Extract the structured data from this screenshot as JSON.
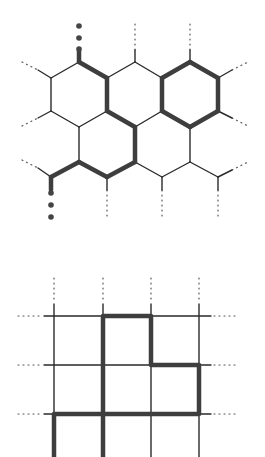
{
  "figure": {
    "colors": {
      "thin_line": "#2a2a2a",
      "thick_line": "#3e3e3e",
      "dots": "#555555",
      "background": "#ffffff"
    }
  },
  "hex_lattice": {
    "vertices": {
      "a1": [
        79,
        62
      ],
      "a2": [
        135,
        62
      ],
      "a3": [
        190,
        62
      ],
      "b0": [
        51,
        78
      ],
      "b1": [
        107,
        78
      ],
      "b2": [
        162,
        78
      ],
      "b3": [
        218,
        78
      ],
      "c0": [
        51,
        111
      ],
      "c1": [
        107,
        111
      ],
      "c2": [
        162,
        111
      ],
      "c3": [
        218,
        111
      ],
      "d1": [
        79,
        127
      ],
      "d2": [
        135,
        127
      ],
      "d3": [
        190,
        127
      ],
      "e1": [
        79,
        162
      ],
      "e2": [
        135,
        162
      ],
      "e3": [
        190,
        162
      ],
      "f0": [
        51,
        177
      ],
      "f1": [
        107,
        177
      ],
      "f2": [
        162,
        177
      ],
      "f3": [
        218,
        177
      ]
    },
    "thin_edges": [
      [
        "b0",
        "a1"
      ],
      [
        "b0",
        "c0"
      ],
      [
        "c0",
        "d1"
      ],
      [
        "d1",
        "c1"
      ],
      [
        "b1",
        "a2"
      ],
      [
        "a2",
        "b2"
      ],
      [
        "c1",
        "d2"
      ],
      [
        "d2",
        "c2"
      ],
      [
        "d1",
        "e1"
      ],
      [
        "e2",
        "f2"
      ],
      [
        "d3",
        "e3"
      ],
      [
        "e3",
        "f2"
      ],
      [
        "e3",
        "f3"
      ]
    ],
    "thick_edges": [
      [
        "a1",
        "b1"
      ],
      [
        "b1",
        "c1"
      ],
      [
        "c1",
        "d2"
      ],
      [
        "d2",
        "e2"
      ],
      [
        "e2",
        "f1"
      ],
      [
        "f1",
        "e1"
      ],
      [
        "e1",
        "f0"
      ],
      [
        "b2",
        "a3"
      ],
      [
        "a3",
        "b3"
      ],
      [
        "b3",
        "c3"
      ],
      [
        "c3",
        "d3"
      ],
      [
        "d3",
        "c2"
      ],
      [
        "c2",
        "b2"
      ]
    ],
    "end_dots": [
      [
        79,
        26
      ],
      [
        79,
        38
      ],
      [
        79,
        49
      ],
      [
        51,
        193
      ],
      [
        51,
        205
      ],
      [
        51,
        217
      ]
    ]
  },
  "square_lattice": {
    "x_lines": [
      54,
      103,
      151,
      199
    ],
    "y_lines": [
      316,
      365,
      414
    ],
    "thick_path": [
      [
        54,
        457
      ],
      [
        54,
        414
      ],
      [
        199,
        414
      ],
      [
        199,
        365
      ],
      [
        151,
        365
      ],
      [
        151,
        316
      ],
      [
        103,
        316
      ],
      [
        103,
        457
      ]
    ]
  }
}
